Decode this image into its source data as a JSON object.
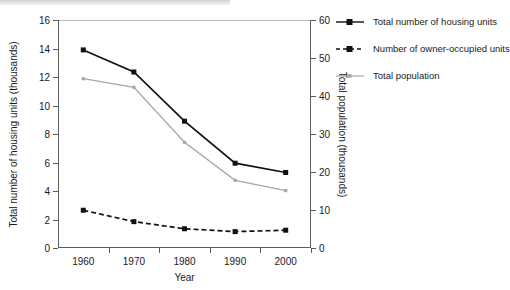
{
  "chart_data": {
    "type": "line",
    "title": "",
    "xlabel": "Year",
    "ylabel": "Total number of housing units (thousands)",
    "y2label": "Total population (thousands)",
    "categories": [
      "1960",
      "1970",
      "1980",
      "1990",
      "2000"
    ],
    "x": [
      1960,
      1970,
      1980,
      1990,
      2000
    ],
    "ylim": [
      0,
      16
    ],
    "y2lim": [
      0,
      60
    ],
    "yticks": [
      "0",
      "2",
      "4",
      "6",
      "8",
      "10",
      "12",
      "14",
      "16"
    ],
    "ytick_values": [
      0,
      2,
      4,
      6,
      8,
      10,
      12,
      14,
      16
    ],
    "y2ticks": [
      "0",
      "10",
      "20",
      "30",
      "40",
      "50",
      "60"
    ],
    "y2tick_values": [
      0,
      10,
      20,
      30,
      40,
      50,
      60
    ],
    "grid": false,
    "legend_position": "right",
    "series": [
      {
        "name": "Total number of housing units",
        "axis": "left",
        "style": "solid",
        "color": "#111111",
        "marker": "square",
        "values": [
          13.9,
          12.35,
          8.9,
          5.95,
          5.3
        ]
      },
      {
        "name": "Number of owner-occupied units",
        "axis": "left",
        "style": "dashed",
        "color": "#111111",
        "marker": "square",
        "values": [
          2.65,
          1.85,
          1.35,
          1.15,
          1.25
        ]
      },
      {
        "name": "Total population",
        "axis": "right",
        "style": "solid",
        "color": "#a6a6a6",
        "marker": "small-square",
        "values": [
          44.5,
          42.3,
          27.8,
          17.8,
          15.1
        ],
        "values_left_scale": [
          11.88,
          11.28,
          7.42,
          4.75,
          4.03
        ]
      }
    ]
  },
  "legend": {
    "items": [
      {
        "label": "Total number of housing units"
      },
      {
        "label": "Number of owner-occupied units"
      },
      {
        "label": "Total population"
      }
    ]
  },
  "colors": {
    "series_black": "#111111",
    "series_gray": "#a6a6a6",
    "axis": "#5c5c5c",
    "background": "#ffffff"
  }
}
